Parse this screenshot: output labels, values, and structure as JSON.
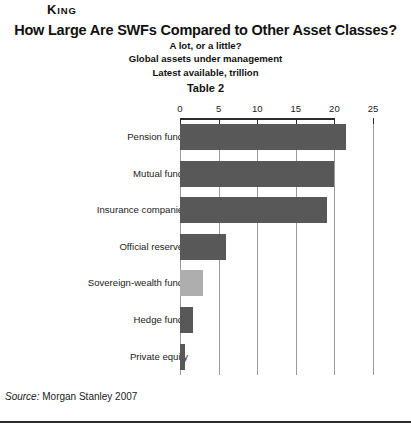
{
  "running_head": {
    "cap": "K",
    "rest": "ING"
  },
  "header": {
    "title": "How Large Are SWFs Compared to Other Asset Classes?",
    "subtitle_1": "A lot, or a little?",
    "subtitle_2": "Global assets under management",
    "subtitle_3": "Latest available, trillion",
    "table_number": "Table 2"
  },
  "source": {
    "label": "Source:",
    "text": "Morgan Stanley 2007"
  },
  "colors": {
    "bar": "#585858",
    "bar_highlight": "#aeaeae",
    "axis": "#2b2b2b",
    "gridline": "#9a9a9a",
    "background": "#ffffff"
  },
  "chart_data": {
    "type": "bar",
    "orientation": "horizontal",
    "title": "How Large Are SWFs Compared to Other Asset Classes?",
    "subtitle": "A lot, or a little? Global assets under management. Latest available, trillion",
    "xlabel": "",
    "ylabel": "",
    "unit": "trillion US$",
    "xlim": [
      0,
      25
    ],
    "xticks": [
      0,
      5,
      10,
      15,
      20,
      25
    ],
    "xtick_labels": [
      "0",
      "5",
      "10",
      "15",
      "20",
      "25"
    ],
    "axis_position": "top",
    "grid": true,
    "grid_axis": "x",
    "legend": false,
    "categories": [
      "Pension funds",
      "Mutual funds",
      "Insurance companies",
      "Official reserves",
      "Sovereign-wealth funds",
      "Hedge funds",
      "Private equity"
    ],
    "values": [
      21.5,
      20.0,
      19.0,
      6.0,
      3.0,
      1.7,
      0.7
    ],
    "highlight_index": 4,
    "source": "Morgan Stanley 2007"
  }
}
